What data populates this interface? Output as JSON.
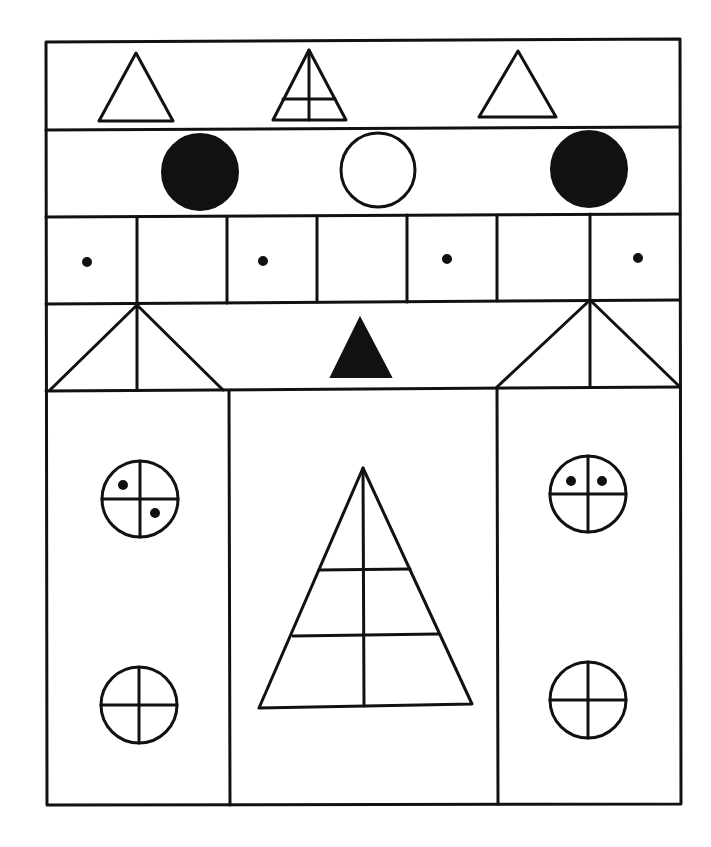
{
  "diagram": {
    "colors": {
      "line": "#111111",
      "background": "#ffffff"
    },
    "frame": {
      "x1": 46,
      "y1": 41,
      "x2": 681,
      "y2": 805
    },
    "rows": {
      "row1_divider_y": 129,
      "row2_divider_y": 216,
      "row3_divider_y": 302,
      "row4_divider_y": 389
    },
    "row1_triangles": [
      {
        "name": "outline-triangle-left",
        "points": "99,121 136,53 173,121",
        "subdivided": false
      },
      {
        "name": "subdivided-triangle-center",
        "points": "273,120 309,50 346,120",
        "subdivided": true
      },
      {
        "name": "outline-triangle-right",
        "points": "479,117 518,51 556,117",
        "subdivided": false
      }
    ],
    "row2_circles": [
      {
        "name": "filled-circle-left",
        "cx": 200,
        "cy": 172,
        "r": 38,
        "filled": true
      },
      {
        "name": "open-circle-center",
        "cx": 378,
        "cy": 170,
        "r": 37,
        "filled": false
      },
      {
        "name": "filled-circle-right",
        "cx": 589,
        "cy": 169,
        "r": 38,
        "filled": true
      }
    ],
    "row3_cells": {
      "count": 7,
      "divider_x": [
        137,
        227,
        317,
        407,
        497,
        590
      ],
      "dots": [
        {
          "cx": 87,
          "cy": 262
        },
        {
          "cx": 263,
          "cy": 261
        },
        {
          "cx": 447,
          "cy": 259
        },
        {
          "cx": 638,
          "cy": 258
        }
      ]
    },
    "row4": {
      "left_roof": {
        "apex": [
          137,
          305
        ],
        "base_left": [
          50,
          390
        ],
        "base_right": [
          223,
          390
        ]
      },
      "right_roof": {
        "apex": [
          590,
          300
        ],
        "base_left": [
          497,
          387
        ],
        "base_right": [
          679,
          386
        ]
      },
      "center_filled_triangle": "331,377 360,318 391,377"
    },
    "lower_section": {
      "column_dividers_x": [
        229,
        497
      ],
      "big_triangle": {
        "apex": [
          363,
          468
        ],
        "base_left": [
          259,
          708
        ],
        "base_right": [
          472,
          704
        ],
        "horizontals": [
          {
            "y": 570,
            "x1": 319,
            "x2": 410
          },
          {
            "y": 635,
            "x1": 293,
            "x2": 438
          }
        ]
      },
      "quartered_circles": [
        {
          "name": "circle-upper-left",
          "cx": 140,
          "cy": 499,
          "r": 38,
          "dots": [
            [
              125,
              485
            ],
            [
              155,
              513
            ]
          ]
        },
        {
          "name": "circle-upper-right",
          "cx": 588,
          "cy": 494,
          "r": 38,
          "dots": [
            [
              571,
              481
            ],
            [
              602,
              481
            ]
          ]
        },
        {
          "name": "circle-lower-left",
          "cx": 139,
          "cy": 705,
          "r": 38,
          "dots": []
        },
        {
          "name": "circle-lower-right",
          "cx": 588,
          "cy": 700,
          "r": 38,
          "dots": []
        }
      ]
    }
  }
}
